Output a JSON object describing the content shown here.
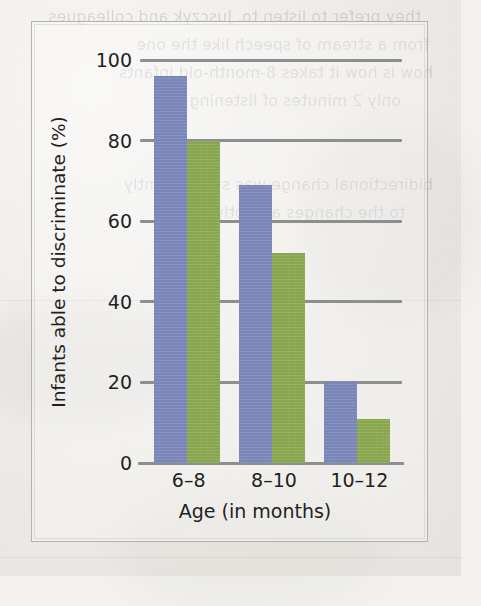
{
  "figure": {
    "frame_border_color": "#b4b2ae",
    "page_background": "#efeeeb"
  },
  "chart_data": {
    "type": "bar",
    "title": "",
    "subtitle": "",
    "xlabel": "Age (in months)",
    "ylabel": "Infants able to discriminate (%)",
    "categories": [
      "6–8",
      "8–10",
      "10–12"
    ],
    "series": [
      {
        "name": "series-1",
        "color": "#7b87bb",
        "values": [
          96,
          69,
          20
        ]
      },
      {
        "name": "series-2",
        "color": "#8aa84f",
        "values": [
          80,
          52,
          11
        ]
      }
    ],
    "ylim": [
      0,
      100
    ],
    "yticks": [
      0,
      20,
      40,
      60,
      80,
      100
    ],
    "ytick_labels": [
      "0",
      "20",
      "40",
      "60",
      "80",
      "100"
    ],
    "xtick_labels": [
      "6–8",
      "8–10",
      "10–12"
    ],
    "grid": "horizontal",
    "gridline_color": "#8e8e8e",
    "legend": "none",
    "legend_position": "none",
    "annotations": [],
    "bar_mode": "grouped"
  },
  "showthrough_text": {
    "description": "faint mirrored text bleeding through from the reverse side of the scanned page",
    "lines": [
      "they prefer to listen to. Jusczyk and colleagues",
      "from a stream of speech like the one",
      "how is how it takes 8-month-old infants",
      "only 2 minutes of listening",
      "bidirectional change was subsequently",
      "to the changes abruptly during"
    ]
  }
}
